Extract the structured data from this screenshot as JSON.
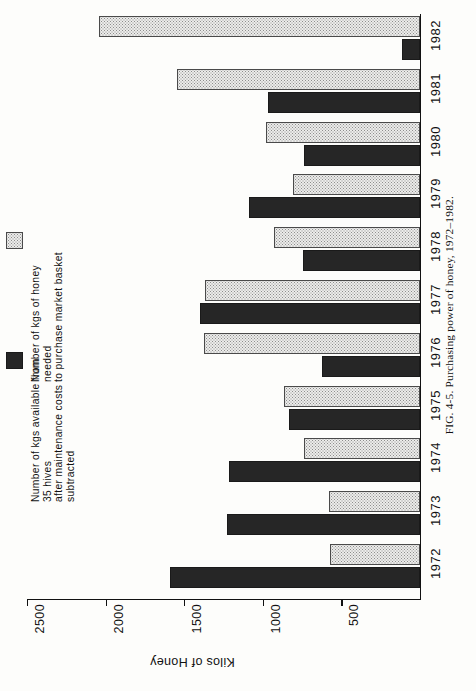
{
  "figure": {
    "caption": "FIG. 4-5.  Purchasing power of honey, 1972–1982."
  },
  "legend": {
    "items": [
      {
        "label": "Number of kgs of honey needed\nto purchase market basket",
        "swatch": "stipple-swatch",
        "color": "#ececea"
      },
      {
        "label": "Number of kgs available from 35 hives\nafter maintenance costs subtracted",
        "swatch": "solid-dark-swatch",
        "color": "#262626"
      }
    ]
  },
  "chart_data": {
    "type": "bar",
    "orientation": "horizontal",
    "title": "Purchasing power of honey, 1972–1982",
    "xlabel": "Kilos of Honey",
    "ylabel": "",
    "categories": [
      "1972",
      "1973",
      "1974",
      "1975",
      "1976",
      "1977",
      "1978",
      "1979",
      "1980",
      "1981",
      "1982"
    ],
    "tick_labels": [
      "2500",
      "2000",
      "1500",
      "1000",
      "500"
    ],
    "tick_values": [
      2500,
      2000,
      1500,
      1000,
      500
    ],
    "xlim": [
      0,
      2500
    ],
    "grid": false,
    "legend_position": "left",
    "series": [
      {
        "name": "Number of kgs of honey needed to purchase market basket",
        "style": "stipple",
        "color": "#ececea",
        "values": [
          575,
          580,
          740,
          865,
          1375,
          1370,
          930,
          805,
          980,
          1545,
          2045
        ]
      },
      {
        "name": "Number of kgs available from 35 hives after maintenance costs subtracted",
        "style": "solid",
        "color": "#262626",
        "values": [
          1590,
          1225,
          1215,
          835,
          625,
          1400,
          745,
          1090,
          740,
          970,
          115
        ]
      }
    ]
  }
}
